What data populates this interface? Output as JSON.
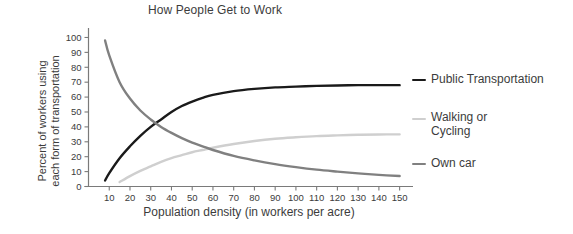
{
  "chart_data": {
    "type": "line",
    "title": "How People Get to Work",
    "xlabel": "Population density (in workers per acre)",
    "ylabel_line1": "Percent of workers using",
    "ylabel_line2": "each form of transportation",
    "xlim": [
      0,
      155
    ],
    "ylim": [
      0,
      103
    ],
    "xticks": [
      10,
      20,
      30,
      40,
      50,
      60,
      70,
      80,
      90,
      100,
      110,
      120,
      130,
      140,
      150
    ],
    "yticks": [
      0,
      10,
      20,
      30,
      40,
      50,
      60,
      70,
      80,
      90,
      100
    ],
    "grid": false,
    "legend_position": "right",
    "x": [
      8,
      10,
      15,
      20,
      25,
      30,
      35,
      40,
      45,
      50,
      55,
      60,
      70,
      80,
      90,
      100,
      110,
      120,
      130,
      140,
      150
    ],
    "series": [
      {
        "name": "Public Transportation",
        "color": "#1a1a1a",
        "values": [
          4,
          9,
          19,
          27,
          34,
          40,
          45,
          50,
          54,
          57,
          59.5,
          61.5,
          64,
          65.5,
          66.5,
          67,
          67.5,
          67.8,
          68,
          68,
          68
        ]
      },
      {
        "name": "Walking or Cycling",
        "color": "#cfcfcf",
        "values": [
          null,
          null,
          3,
          7,
          10.5,
          13.5,
          16.5,
          19,
          21,
          23,
          24.5,
          26,
          28.5,
          30.5,
          32,
          33,
          33.8,
          34.3,
          34.7,
          34.9,
          35
        ]
      },
      {
        "name": "Own car",
        "color": "#808080",
        "values": [
          98,
          88,
          70,
          59,
          51,
          45,
          40,
          36,
          32.5,
          29.5,
          27,
          24.5,
          20.5,
          17.5,
          15,
          13,
          11.3,
          10,
          8.8,
          7.8,
          7
        ]
      }
    ]
  },
  "legend": [
    {
      "label": "Public Transportation",
      "color": "#1a1a1a"
    },
    {
      "label": "Walking or\nCycling",
      "color": "#cfcfcf"
    },
    {
      "label": "Own car",
      "color": "#808080"
    }
  ]
}
